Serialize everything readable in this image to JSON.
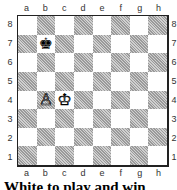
{
  "board": {
    "files": [
      "a",
      "b",
      "c",
      "d",
      "e",
      "f",
      "g",
      "h"
    ],
    "ranks": [
      "8",
      "7",
      "6",
      "5",
      "4",
      "3",
      "2",
      "1"
    ],
    "pieces": [
      {
        "square": "b7",
        "color": "black",
        "type": "king",
        "glyph": "♚"
      },
      {
        "square": "b4",
        "color": "white",
        "type": "pawn",
        "glyph": "♙"
      },
      {
        "square": "c4",
        "color": "white",
        "type": "king",
        "glyph": "♔"
      }
    ]
  },
  "caption": "White to play and win"
}
